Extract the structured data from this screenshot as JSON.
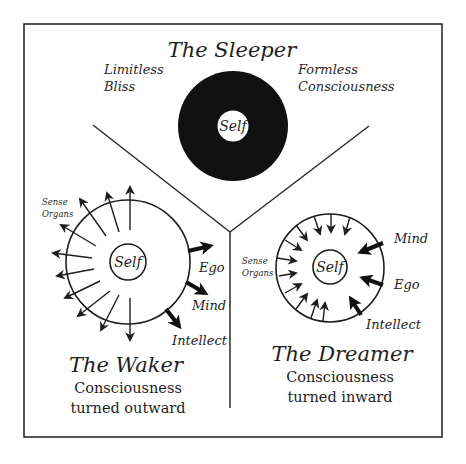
{
  "diagram": {
    "sleeper": {
      "title": "The Sleeper",
      "left_note": [
        "Limitless",
        "Bliss"
      ],
      "right_note": [
        "Formless",
        "Consciousness"
      ],
      "center_label": "Self",
      "fill_color": "#111111"
    },
    "waker": {
      "title": "The Waker",
      "caption": [
        "Consciousness",
        "turned outward"
      ],
      "center_label": "Self",
      "sense_label": [
        "Sense",
        "Organs"
      ],
      "arrow_direction": "outward",
      "labels": {
        "ego": "Ego",
        "mind": "Mind",
        "intellect": "Intellect"
      }
    },
    "dreamer": {
      "title": "The Dreamer",
      "caption": [
        "Consciousness",
        "turned inward"
      ],
      "center_label": "Self",
      "sense_label": [
        "Sense",
        "Organs"
      ],
      "arrow_direction": "inward",
      "labels": {
        "mind": "Mind",
        "ego": "Ego",
        "intellect": "Intellect"
      }
    }
  }
}
